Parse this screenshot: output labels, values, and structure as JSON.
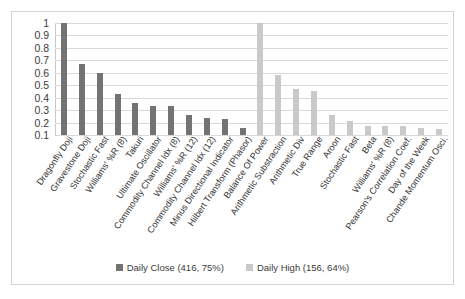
{
  "chart_data": {
    "type": "bar",
    "title": "",
    "subtitle": "",
    "xlabel": "",
    "ylabel": "",
    "ylim": [
      0.1,
      1
    ],
    "ytick_labels": [
      "1",
      "0.9",
      "0.8",
      "0.7",
      "0.6",
      "0.5",
      "0.4",
      "0.3",
      "0.2",
      "0.1"
    ],
    "ytick_values": [
      1,
      0.9,
      0.8,
      0.7,
      0.6,
      0.5,
      0.4,
      0.3,
      0.2,
      0.1
    ],
    "grid": true,
    "legend_position": "bottom",
    "categories": [
      "Dragonfly Doji",
      "Gravestone Doji",
      "Stochastic Fast",
      "Williams' %R (8)",
      "Takuri",
      "Ultimate Oscillator",
      "Commodity Channel Idx (8)",
      "Williams' %R (12)",
      "Commodity Channel Idx (12)",
      "Minus Directional Indicator",
      "Hilbert Transform (Phasor)",
      "Balance Of Power",
      "Arithmetic Substraction",
      "Arithmetic Div",
      "True Range",
      "Aroon",
      "Stochastic Fast",
      "Beta",
      "Williams' %R (8)",
      "Pearson's Correlation Coef.",
      "Day of the Week",
      "Chande Momentum Osci."
    ],
    "series": [
      {
        "name": "Daily Close (416, 75%)",
        "color": "#737373",
        "values": [
          1.0,
          0.67,
          0.6,
          0.43,
          0.36,
          0.33,
          0.33,
          0.26,
          0.24,
          0.23,
          0.16,
          null,
          null,
          null,
          null,
          null,
          null,
          null,
          null,
          null,
          null,
          null
        ]
      },
      {
        "name": "Daily High (156, 64%)",
        "color": "#c9c9c9",
        "values": [
          null,
          null,
          null,
          null,
          null,
          null,
          null,
          null,
          null,
          null,
          null,
          1.0,
          0.58,
          0.47,
          0.45,
          0.26,
          0.21,
          0.17,
          0.17,
          0.17,
          0.16,
          0.15
        ]
      }
    ]
  },
  "legend": {
    "items": [
      {
        "label": "Daily Close (416, 75%)",
        "color": "#737373"
      },
      {
        "label": "Daily High (156, 64%)",
        "color": "#c9c9c9"
      }
    ]
  }
}
